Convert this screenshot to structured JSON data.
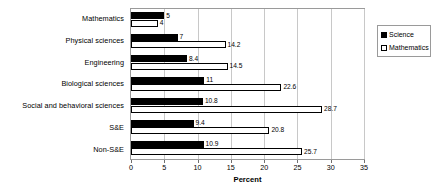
{
  "chart_data": {
    "type": "bar",
    "orientation": "horizontal",
    "title": "",
    "xlabel": "Percent",
    "ylabel": "",
    "xlim": [
      0,
      35
    ],
    "xticks": [
      0,
      5,
      10,
      15,
      20,
      25,
      30,
      35
    ],
    "xticklabels": [
      "0",
      "5",
      "10",
      "15",
      "20",
      "25",
      "30",
      "35"
    ],
    "grid": true,
    "grid_axis": "x",
    "legend_position": "right",
    "categories": [
      "Mathematics",
      "Physical sciences",
      "Engineering",
      "Biological sciences",
      "Social and behavioral sciences",
      "S&E",
      "Non-S&E"
    ],
    "series": [
      {
        "name": "Science",
        "color": "#000000",
        "style": "filled",
        "values": [
          5,
          7,
          8.4,
          11,
          10.8,
          9.4,
          10.9
        ],
        "labels": [
          "5",
          "7",
          "8.4",
          "11",
          "10.8",
          "9.4",
          "10.9"
        ]
      },
      {
        "name": "Mathematics",
        "color": "#ffffff",
        "style": "hollow",
        "values": [
          4,
          14.2,
          14.5,
          22.6,
          28.7,
          20.8,
          25.7
        ],
        "labels": [
          "4",
          "14.2",
          "14.5",
          "22.6",
          "28.7",
          "20.8",
          "25.7"
        ]
      }
    ]
  },
  "legend": {
    "items": [
      {
        "label": "Science",
        "swatch": "filled"
      },
      {
        "label": "Mathematics",
        "swatch": "hollow"
      }
    ]
  }
}
